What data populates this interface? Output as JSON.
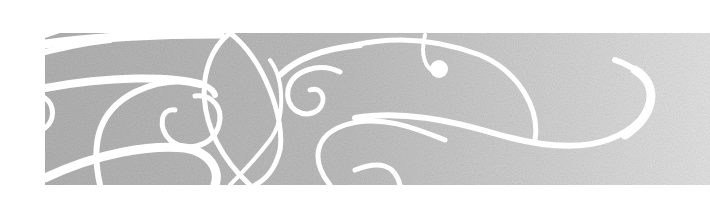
{
  "image": {
    "description": "Decorative gray textured banner with white swirl flourishes",
    "colors": {
      "background": "#ffffff",
      "band_left": "#b3b3b3",
      "band_right": "#dedede",
      "swirl": "#ffffff"
    }
  }
}
